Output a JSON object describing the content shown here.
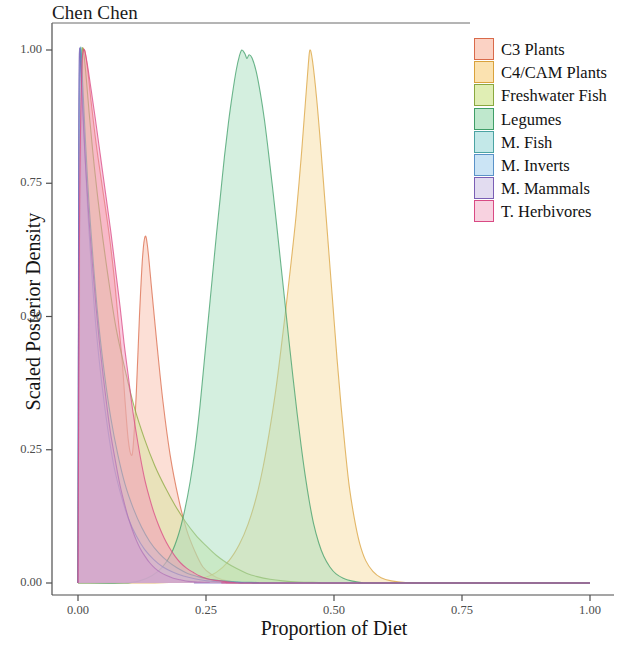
{
  "title": "Chen Chen",
  "axes": {
    "x_label": "Proportion of Diet",
    "y_label": "Scaled Posterior Density",
    "x_ticks": [
      "0.00",
      "0.25",
      "0.50",
      "0.75",
      "1.00"
    ],
    "y_ticks": [
      "0.00",
      "0.25",
      "0.50",
      "0.75",
      "1.00"
    ]
  },
  "legend": {
    "items": [
      {
        "label": "C3 Plants",
        "color": "#fbd2c4"
      },
      {
        "label": "C4/CAM Plants",
        "color": "#fbe2b0"
      },
      {
        "label": "Freshwater Fish",
        "color": "#e0eeb4"
      },
      {
        "label": "Legumes",
        "color": "#bfe8cd"
      },
      {
        "label": "M. Fish",
        "color": "#c3e8e8"
      },
      {
        "label": "M. Inverts",
        "color": "#cbe4f5"
      },
      {
        "label": "M. Mammals",
        "color": "#e2dcf0"
      },
      {
        "label": "T. Herbivores",
        "color": "#f8d2e0"
      }
    ]
  },
  "chart_data": {
    "type": "area",
    "title": "Chen Chen",
    "xlabel": "Proportion of Diet",
    "ylabel": "Scaled Posterior Density",
    "xlim": [
      0.0,
      1.0
    ],
    "ylim": [
      0.0,
      1.0
    ],
    "grid": false,
    "legend_position": "top-right",
    "series": [
      {
        "name": "C3 Plants",
        "fill": "#f9b8a4",
        "stroke": "#d96a4a",
        "mode": 0.128,
        "peak_density": 0.65,
        "points": [
          [
            0.0,
            0.0
          ],
          [
            0.004,
            0.62
          ],
          [
            0.008,
            0.96
          ],
          [
            0.012,
            1.0
          ],
          [
            0.018,
            0.97
          ],
          [
            0.026,
            0.9
          ],
          [
            0.036,
            0.82
          ],
          [
            0.048,
            0.74
          ],
          [
            0.06,
            0.66
          ],
          [
            0.07,
            0.58
          ],
          [
            0.078,
            0.5
          ],
          [
            0.086,
            0.42
          ],
          [
            0.092,
            0.34
          ],
          [
            0.098,
            0.27
          ],
          [
            0.104,
            0.24
          ],
          [
            0.108,
            0.26
          ],
          [
            0.114,
            0.36
          ],
          [
            0.12,
            0.5
          ],
          [
            0.126,
            0.61
          ],
          [
            0.131,
            0.65
          ],
          [
            0.136,
            0.63
          ],
          [
            0.144,
            0.55
          ],
          [
            0.154,
            0.45
          ],
          [
            0.166,
            0.34
          ],
          [
            0.18,
            0.24
          ],
          [
            0.196,
            0.16
          ],
          [
            0.212,
            0.1
          ],
          [
            0.228,
            0.06
          ],
          [
            0.244,
            0.03
          ],
          [
            0.262,
            0.015
          ],
          [
            0.282,
            0.006
          ],
          [
            0.31,
            0.002
          ],
          [
            0.35,
            0.0
          ],
          [
            1.0,
            0.0
          ]
        ]
      },
      {
        "name": "C4/CAM Plants",
        "fill": "#f7d99a",
        "stroke": "#d9a23c",
        "mode": 0.452,
        "peak_density": 1.0,
        "points": [
          [
            0.0,
            0.0
          ],
          [
            0.15,
            0.0
          ],
          [
            0.2,
            0.002
          ],
          [
            0.24,
            0.008
          ],
          [
            0.27,
            0.02
          ],
          [
            0.295,
            0.042
          ],
          [
            0.315,
            0.072
          ],
          [
            0.332,
            0.11
          ],
          [
            0.348,
            0.16
          ],
          [
            0.362,
            0.22
          ],
          [
            0.374,
            0.285
          ],
          [
            0.386,
            0.36
          ],
          [
            0.396,
            0.435
          ],
          [
            0.406,
            0.515
          ],
          [
            0.416,
            0.6
          ],
          [
            0.426,
            0.69
          ],
          [
            0.436,
            0.8
          ],
          [
            0.444,
            0.9
          ],
          [
            0.45,
            0.975
          ],
          [
            0.453,
            1.0
          ],
          [
            0.458,
            0.98
          ],
          [
            0.466,
            0.91
          ],
          [
            0.474,
            0.82
          ],
          [
            0.482,
            0.72
          ],
          [
            0.49,
            0.62
          ],
          [
            0.498,
            0.52
          ],
          [
            0.506,
            0.42
          ],
          [
            0.514,
            0.33
          ],
          [
            0.522,
            0.25
          ],
          [
            0.53,
            0.18
          ],
          [
            0.54,
            0.12
          ],
          [
            0.55,
            0.075
          ],
          [
            0.562,
            0.042
          ],
          [
            0.576,
            0.022
          ],
          [
            0.592,
            0.01
          ],
          [
            0.612,
            0.004
          ],
          [
            0.64,
            0.001
          ],
          [
            0.7,
            0.0
          ],
          [
            1.0,
            0.0
          ]
        ]
      },
      {
        "name": "Freshwater Fish",
        "fill": "#d3e69a",
        "stroke": "#8aa83f",
        "mode": 0.01,
        "peak_density": 1.0,
        "points": [
          [
            0.0,
            0.0
          ],
          [
            0.003,
            0.7
          ],
          [
            0.007,
            0.97
          ],
          [
            0.01,
            1.0
          ],
          [
            0.015,
            0.96
          ],
          [
            0.022,
            0.88
          ],
          [
            0.032,
            0.78
          ],
          [
            0.044,
            0.68
          ],
          [
            0.058,
            0.58
          ],
          [
            0.074,
            0.48
          ],
          [
            0.092,
            0.4
          ],
          [
            0.11,
            0.33
          ],
          [
            0.13,
            0.27
          ],
          [
            0.15,
            0.22
          ],
          [
            0.17,
            0.18
          ],
          [
            0.19,
            0.145
          ],
          [
            0.21,
            0.115
          ],
          [
            0.23,
            0.09
          ],
          [
            0.25,
            0.07
          ],
          [
            0.27,
            0.052
          ],
          [
            0.29,
            0.038
          ],
          [
            0.31,
            0.027
          ],
          [
            0.33,
            0.018
          ],
          [
            0.35,
            0.012
          ],
          [
            0.375,
            0.007
          ],
          [
            0.4,
            0.004
          ],
          [
            0.43,
            0.002
          ],
          [
            0.47,
            0.001
          ],
          [
            0.52,
            0.0
          ],
          [
            1.0,
            0.0
          ]
        ]
      },
      {
        "name": "Legumes",
        "fill": "#9fdcb8",
        "stroke": "#3f9e68",
        "mode": 0.322,
        "peak_density": 1.0,
        "points": [
          [
            0.0,
            0.0
          ],
          [
            0.09,
            0.0
          ],
          [
            0.12,
            0.004
          ],
          [
            0.145,
            0.014
          ],
          [
            0.165,
            0.03
          ],
          [
            0.182,
            0.055
          ],
          [
            0.196,
            0.09
          ],
          [
            0.208,
            0.135
          ],
          [
            0.219,
            0.19
          ],
          [
            0.229,
            0.255
          ],
          [
            0.238,
            0.33
          ],
          [
            0.246,
            0.41
          ],
          [
            0.254,
            0.49
          ],
          [
            0.262,
            0.57
          ],
          [
            0.27,
            0.65
          ],
          [
            0.278,
            0.725
          ],
          [
            0.286,
            0.8
          ],
          [
            0.294,
            0.865
          ],
          [
            0.302,
            0.92
          ],
          [
            0.309,
            0.962
          ],
          [
            0.315,
            0.988
          ],
          [
            0.32,
            1.0
          ],
          [
            0.326,
            0.993
          ],
          [
            0.33,
            0.984
          ],
          [
            0.334,
            0.991
          ],
          [
            0.34,
            0.985
          ],
          [
            0.348,
            0.96
          ],
          [
            0.356,
            0.92
          ],
          [
            0.364,
            0.87
          ],
          [
            0.372,
            0.808
          ],
          [
            0.38,
            0.742
          ],
          [
            0.388,
            0.672
          ],
          [
            0.396,
            0.6
          ],
          [
            0.404,
            0.528
          ],
          [
            0.412,
            0.455
          ],
          [
            0.42,
            0.385
          ],
          [
            0.428,
            0.318
          ],
          [
            0.436,
            0.256
          ],
          [
            0.444,
            0.2
          ],
          [
            0.452,
            0.152
          ],
          [
            0.46,
            0.112
          ],
          [
            0.47,
            0.076
          ],
          [
            0.48,
            0.05
          ],
          [
            0.492,
            0.03
          ],
          [
            0.504,
            0.017
          ],
          [
            0.518,
            0.009
          ],
          [
            0.534,
            0.004
          ],
          [
            0.554,
            0.001
          ],
          [
            0.59,
            0.0
          ],
          [
            1.0,
            0.0
          ]
        ]
      },
      {
        "name": "M. Fish",
        "fill": "#a8dcdc",
        "stroke": "#4ba3a3",
        "mode": 0.006,
        "peak_density": 1.0,
        "points": [
          [
            0.0,
            0.0
          ],
          [
            0.002,
            0.8
          ],
          [
            0.005,
            1.0
          ],
          [
            0.009,
            0.94
          ],
          [
            0.014,
            0.84
          ],
          [
            0.021,
            0.72
          ],
          [
            0.03,
            0.6
          ],
          [
            0.04,
            0.49
          ],
          [
            0.052,
            0.39
          ],
          [
            0.064,
            0.31
          ],
          [
            0.078,
            0.24
          ],
          [
            0.092,
            0.185
          ],
          [
            0.108,
            0.14
          ],
          [
            0.124,
            0.105
          ],
          [
            0.14,
            0.078
          ],
          [
            0.158,
            0.056
          ],
          [
            0.176,
            0.04
          ],
          [
            0.194,
            0.028
          ],
          [
            0.214,
            0.018
          ],
          [
            0.234,
            0.012
          ],
          [
            0.256,
            0.007
          ],
          [
            0.28,
            0.004
          ],
          [
            0.31,
            0.002
          ],
          [
            0.35,
            0.001
          ],
          [
            0.4,
            0.0
          ],
          [
            1.0,
            0.0
          ]
        ]
      },
      {
        "name": "M. Inverts",
        "fill": "#b2d6f0",
        "stroke": "#5a92c8",
        "mode": 0.005,
        "peak_density": 1.0,
        "points": [
          [
            0.0,
            0.0
          ],
          [
            0.002,
            0.82
          ],
          [
            0.004,
            1.0
          ],
          [
            0.008,
            0.93
          ],
          [
            0.013,
            0.82
          ],
          [
            0.019,
            0.7
          ],
          [
            0.027,
            0.58
          ],
          [
            0.036,
            0.47
          ],
          [
            0.047,
            0.37
          ],
          [
            0.058,
            0.29
          ],
          [
            0.07,
            0.22
          ],
          [
            0.084,
            0.165
          ],
          [
            0.098,
            0.122
          ],
          [
            0.114,
            0.088
          ],
          [
            0.13,
            0.063
          ],
          [
            0.148,
            0.044
          ],
          [
            0.166,
            0.03
          ],
          [
            0.186,
            0.02
          ],
          [
            0.206,
            0.013
          ],
          [
            0.228,
            0.008
          ],
          [
            0.252,
            0.004
          ],
          [
            0.28,
            0.002
          ],
          [
            0.32,
            0.001
          ],
          [
            0.38,
            0.0
          ],
          [
            1.0,
            0.0
          ]
        ]
      },
      {
        "name": "M. Mammals",
        "fill": "#b9a8dd",
        "stroke": "#7a5fb5",
        "mode": 0.004,
        "peak_density": 1.0,
        "points": [
          [
            0.0,
            0.0
          ],
          [
            0.0015,
            0.85
          ],
          [
            0.003,
            1.0
          ],
          [
            0.006,
            0.95
          ],
          [
            0.01,
            0.87
          ],
          [
            0.015,
            0.78
          ],
          [
            0.021,
            0.69
          ],
          [
            0.028,
            0.6
          ],
          [
            0.035,
            0.52
          ],
          [
            0.042,
            0.45
          ],
          [
            0.049,
            0.39
          ],
          [
            0.056,
            0.335
          ],
          [
            0.063,
            0.285
          ],
          [
            0.07,
            0.245
          ],
          [
            0.077,
            0.208
          ],
          [
            0.084,
            0.175
          ],
          [
            0.091,
            0.148
          ],
          [
            0.098,
            0.123
          ],
          [
            0.106,
            0.1
          ],
          [
            0.114,
            0.08
          ],
          [
            0.122,
            0.064
          ],
          [
            0.131,
            0.05
          ],
          [
            0.14,
            0.038
          ],
          [
            0.15,
            0.028
          ],
          [
            0.161,
            0.02
          ],
          [
            0.173,
            0.014
          ],
          [
            0.186,
            0.009
          ],
          [
            0.2,
            0.006
          ],
          [
            0.216,
            0.003
          ],
          [
            0.234,
            0.002
          ],
          [
            0.256,
            0.001
          ],
          [
            0.29,
            0.0
          ],
          [
            1.0,
            0.0
          ]
        ]
      },
      {
        "name": "T. Herbivores",
        "fill": "#f58cb8",
        "stroke": "#d94a84",
        "mode": 0.1,
        "peak_density": 1.0,
        "points": [
          [
            0.0,
            0.0
          ],
          [
            0.003,
            0.68
          ],
          [
            0.007,
            0.95
          ],
          [
            0.011,
            1.0
          ],
          [
            0.017,
            0.98
          ],
          [
            0.025,
            0.93
          ],
          [
            0.034,
            0.87
          ],
          [
            0.044,
            0.8
          ],
          [
            0.054,
            0.73
          ],
          [
            0.064,
            0.66
          ],
          [
            0.073,
            0.59
          ],
          [
            0.082,
            0.52
          ],
          [
            0.09,
            0.45
          ],
          [
            0.098,
            0.39
          ],
          [
            0.106,
            0.33
          ],
          [
            0.114,
            0.28
          ],
          [
            0.122,
            0.235
          ],
          [
            0.13,
            0.196
          ],
          [
            0.139,
            0.162
          ],
          [
            0.148,
            0.133
          ],
          [
            0.158,
            0.107
          ],
          [
            0.168,
            0.085
          ],
          [
            0.178,
            0.067
          ],
          [
            0.189,
            0.051
          ],
          [
            0.2,
            0.038
          ],
          [
            0.212,
            0.028
          ],
          [
            0.225,
            0.02
          ],
          [
            0.238,
            0.013
          ],
          [
            0.252,
            0.008
          ],
          [
            0.268,
            0.005
          ],
          [
            0.286,
            0.003
          ],
          [
            0.306,
            0.001
          ],
          [
            0.34,
            0.0
          ],
          [
            1.0,
            0.0
          ]
        ]
      }
    ]
  }
}
